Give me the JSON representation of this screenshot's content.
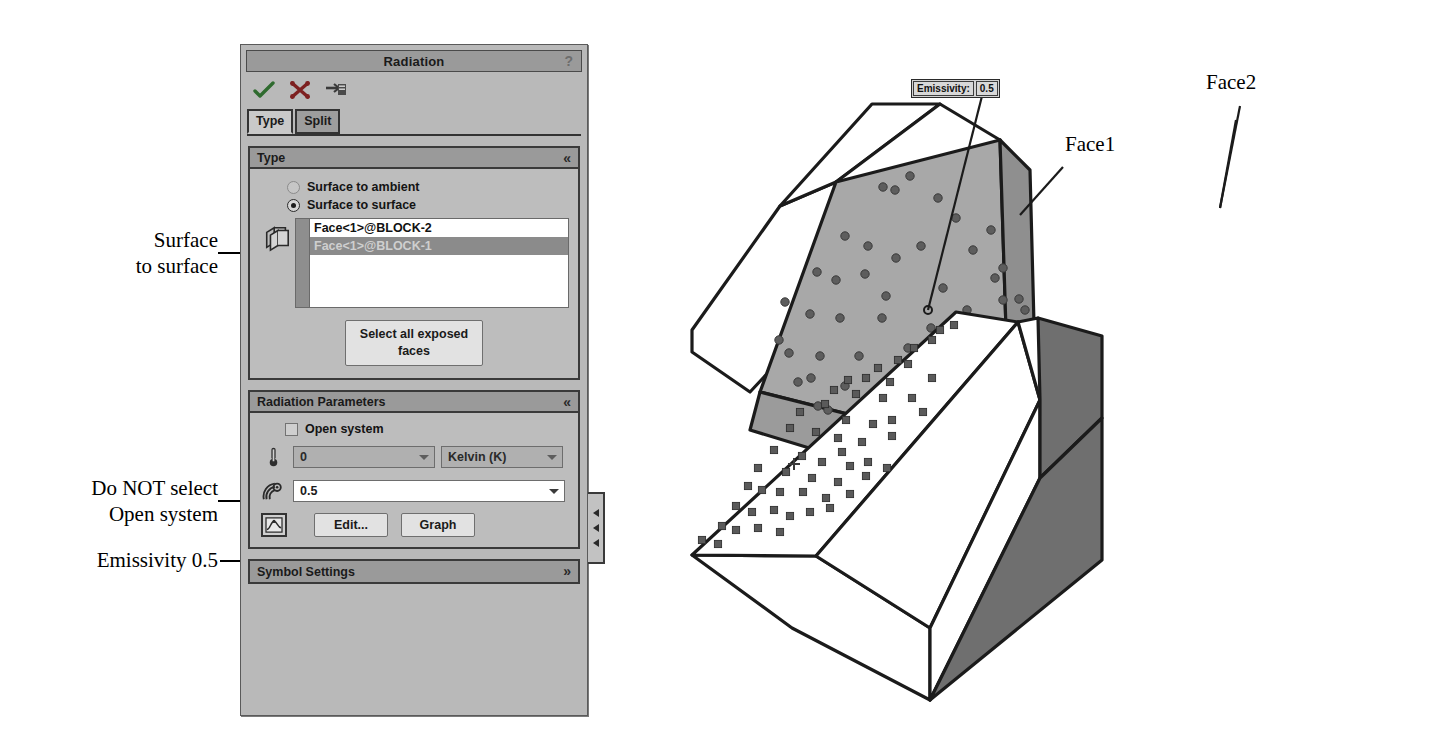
{
  "panel": {
    "title": "Radiation",
    "help": "?",
    "toolbar": [
      {
        "name": "ok-icon",
        "label": "OK"
      },
      {
        "name": "cancel-icon",
        "label": "Cancel"
      },
      {
        "name": "preview-icon",
        "label": "Preview"
      }
    ],
    "tabs": [
      {
        "label": "Type",
        "active": true
      },
      {
        "label": "Split",
        "active": false
      }
    ],
    "type_section": {
      "title": "Type",
      "collapse_glyph": "«",
      "radios": [
        {
          "label": "Surface to ambient",
          "selected": false
        },
        {
          "label": "Surface to surface",
          "selected": true
        }
      ],
      "face_list": [
        {
          "label": "Face<1>@BLOCK-2",
          "selected": false
        },
        {
          "label": "Face<1>@BLOCK-1",
          "selected": true
        }
      ],
      "select_faces_button": "Select all exposed faces"
    },
    "radiation_parameters": {
      "title": "Radiation Parameters",
      "collapse_glyph": "«",
      "open_system": {
        "label": "Open system",
        "checked": false
      },
      "temperature": {
        "value": "0",
        "enabled": false
      },
      "units": {
        "value": "Kelvin (K)",
        "enabled": false
      },
      "emissivity": {
        "value": "0.5",
        "enabled": true
      },
      "edit_button": "Edit...",
      "graph_button": "Graph"
    },
    "symbol_settings": {
      "title": "Symbol Settings",
      "expand_glyph": "»"
    }
  },
  "annotations": [
    {
      "name": "annotation-surface-to-surface",
      "text": "Surface\nto surface"
    },
    {
      "name": "annotation-open-system",
      "text": "Do NOT select\nOpen system"
    },
    {
      "name": "annotation-emissivity",
      "text": "Emissivity 0.5"
    }
  ],
  "graphics": {
    "callout": {
      "label": "Emissivity:",
      "value": "0.5"
    },
    "face1_label": "Face1",
    "face2_label": "Face2"
  },
  "colors": {
    "panel_bg": "#b9b9b9",
    "header_bg": "#9a9a9a",
    "selected_row": "#8b8b8b",
    "highlight_face": "#a8a8a8",
    "dark_face": "#6f6f6f",
    "accent_ok": "#2f6b2f",
    "accent_cancel": "#8e2020"
  }
}
